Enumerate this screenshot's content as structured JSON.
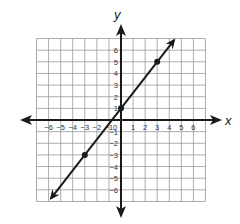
{
  "chart_data": {
    "type": "line",
    "title": "",
    "xlabel": "x",
    "ylabel": "y",
    "xlim": [
      -7,
      7
    ],
    "ylim": [
      -7,
      7
    ],
    "grid": true,
    "x_ticks": [
      "-6",
      "-5",
      "-4",
      "-3",
      "-2",
      "-1",
      "0",
      "1",
      "2",
      "3",
      "4",
      "5",
      "6"
    ],
    "y_ticks": [
      "6",
      "5",
      "4",
      "3",
      "2",
      "1",
      "-1",
      "-2",
      "-3",
      "-4",
      "-5",
      "-6"
    ],
    "series": [
      {
        "name": "line",
        "equation": "y = (4/3)x + 1",
        "slope": 1.3333,
        "intercept": 1,
        "points": [
          {
            "x": -3,
            "y": -3
          },
          {
            "x": 0,
            "y": 1
          },
          {
            "x": 3,
            "y": 5
          }
        ],
        "arrows_both_ends": true
      }
    ],
    "colors": {
      "line": "#1a1a1a",
      "grid": "#999999",
      "axis": "#1a1a1a"
    }
  }
}
